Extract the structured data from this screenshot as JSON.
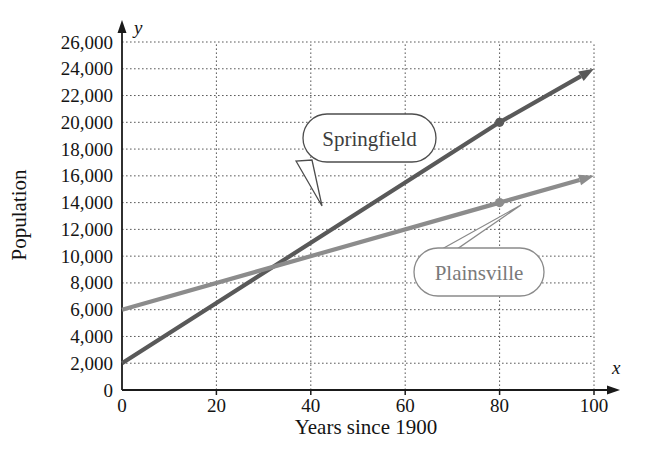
{
  "chart_data": {
    "type": "line",
    "title": "",
    "xlabel": "Years since 1900",
    "ylabel": "Population",
    "x_axis_letter": "x",
    "y_axis_letter": "y",
    "xlim": [
      0,
      100
    ],
    "ylim": [
      0,
      26000
    ],
    "grid": true,
    "grid_style": "dotted",
    "legend_position": "inline-callouts",
    "xticks": [
      0,
      20,
      40,
      60,
      80,
      100
    ],
    "xtick_labels": [
      "0",
      "20",
      "40",
      "60",
      "80",
      "100"
    ],
    "yticks": [
      0,
      2000,
      4000,
      6000,
      8000,
      10000,
      12000,
      14000,
      16000,
      18000,
      20000,
      22000,
      24000,
      26000
    ],
    "ytick_labels": [
      "0",
      "2,000",
      "4,000",
      "6,000",
      "8,000",
      "10,000",
      "12,000",
      "14,000",
      "16,000",
      "18,000",
      "20,000",
      "22,000",
      "24,000",
      "26,000"
    ],
    "series": [
      {
        "name": "Springfield",
        "color": "#595959",
        "x": [
          0,
          80,
          100
        ],
        "values": [
          2000,
          20000,
          24000
        ],
        "marked_points": [
          {
            "x": 80,
            "y": 20000
          }
        ],
        "arrow_end": true
      },
      {
        "name": "Plainsville",
        "color": "#8c8c8c",
        "x": [
          0,
          80,
          100
        ],
        "values": [
          6000,
          14000,
          16000
        ],
        "marked_points": [
          {
            "x": 80,
            "y": 14000
          }
        ],
        "arrow_end": true
      }
    ],
    "annotations": [
      {
        "label": "Springfield",
        "points_to": {
          "x": 47,
          "y": 12400
        }
      },
      {
        "label": "Plainsville",
        "points_to": {
          "x": 72,
          "y": 13200
        }
      }
    ]
  },
  "colors": {
    "springfield": "#595959",
    "plainsville": "#8c8c8c",
    "axis": "#1a1a1a",
    "grid": "#5a5a5a",
    "callout_stroke_springfield": "#4d4d4d",
    "callout_stroke_plainsville": "#8a8a8a",
    "background": "#ffffff"
  }
}
